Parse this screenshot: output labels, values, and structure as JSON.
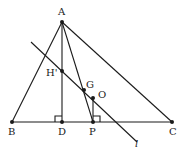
{
  "diagram": {
    "type": "geometry",
    "points": {
      "A": {
        "label": "A",
        "x": 62,
        "y": 22
      },
      "B": {
        "label": "B",
        "x": 12,
        "y": 122
      },
      "C": {
        "label": "C",
        "x": 172,
        "y": 122
      },
      "D": {
        "label": "D",
        "x": 62,
        "y": 122
      },
      "P": {
        "label": "P",
        "x": 93,
        "y": 122
      },
      "H": {
        "label": "H'",
        "x": 62,
        "y": 71
      },
      "G": {
        "label": "G",
        "x": 84,
        "y": 90
      },
      "O": {
        "label": "O",
        "x": 93,
        "y": 98
      }
    },
    "line_label": "l",
    "color": "#1a1a1a"
  }
}
